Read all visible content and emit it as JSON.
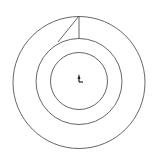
{
  "diagram": {
    "type": "cad-sketch",
    "stroke_color": "#555555",
    "background": "#ffffff",
    "center": {
      "x": 79,
      "y": 82
    },
    "circles": [
      {
        "name": "outer-circle",
        "cx": 79,
        "cy": 82.5,
        "r": 66
      },
      {
        "name": "middle-circle",
        "cx": 79,
        "cy": 81.5,
        "r": 43
      },
      {
        "name": "inner-circle",
        "cx": 79,
        "cy": 81,
        "r": 28.5
      }
    ],
    "lines": [
      {
        "name": "vertical-radial-line",
        "x1": 79,
        "y1": 16,
        "x2": 79,
        "y2": 38.5
      },
      {
        "name": "diagonal-line",
        "x1": 79,
        "y1": 16,
        "x2": 58,
        "y2": 42
      }
    ],
    "origin_marker": {
      "name": "origin-axis-marker",
      "x": 79,
      "y": 81
    },
    "caption": ""
  }
}
